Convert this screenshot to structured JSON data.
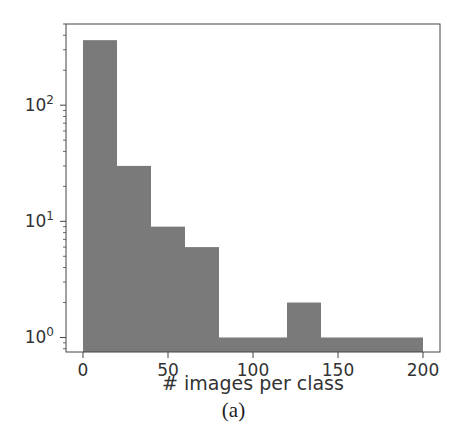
{
  "chart_data": {
    "type": "bar",
    "subtype": "histogram",
    "title": "",
    "xlabel": "# images per class",
    "ylabel": "",
    "yscale": "log",
    "ylim": [
      0.75,
      500
    ],
    "xlim": [
      -10,
      210
    ],
    "bin_edges": [
      0,
      20,
      40,
      60,
      80,
      100,
      120,
      140,
      160,
      180,
      200
    ],
    "values": [
      363,
      30,
      9,
      6,
      1,
      1,
      2,
      1,
      1,
      1
    ],
    "x_ticks": [
      0,
      50,
      100,
      150,
      200
    ],
    "x_tick_labels": [
      "0",
      "50",
      "100",
      "150",
      "200"
    ],
    "y_ticks": [
      1,
      10,
      100
    ],
    "y_tick_labels": [
      {
        "base": "10",
        "exp": "0"
      },
      {
        "base": "10",
        "exp": "1"
      },
      {
        "base": "10",
        "exp": "2"
      }
    ],
    "grid": false,
    "legend": null,
    "bar_color": "#7a7a7a"
  },
  "caption": "(a)"
}
